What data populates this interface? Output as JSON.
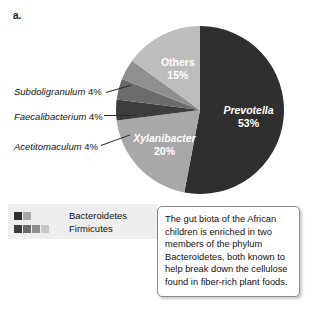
{
  "panel": {
    "letter": "a."
  },
  "chart_data": {
    "type": "pie",
    "title": "",
    "legend_position": "bottom-left",
    "start_angle_deg": 0,
    "direction": "clockwise",
    "categories": [
      "Prevotella",
      "Xylanibacter",
      "Acetitomaculum",
      "Faecalibacterium",
      "Subdoligranulum",
      "Others"
    ],
    "values": [
      53,
      20,
      4,
      4,
      4,
      15
    ],
    "unit": "%",
    "slices": [
      {
        "name": "Prevotella",
        "value": 53,
        "label": "Prevotella",
        "pct_label": "53%",
        "color": "#2f2f2f",
        "label_inside": true,
        "italic": true
      },
      {
        "name": "Xylanibacter",
        "value": 20,
        "label": "Xylanibacter",
        "pct_label": "20%",
        "color": "#a8a8a8",
        "label_inside": true,
        "italic": true
      },
      {
        "name": "Acetitomaculum",
        "value": 4,
        "label": "Acetitomaculum",
        "pct_label": "4%",
        "color": "#3d3d3d",
        "label_inside": false,
        "italic": true
      },
      {
        "name": "Faecalibacterium",
        "value": 4,
        "label": "Faecalibacterium",
        "pct_label": "4%",
        "color": "#6b6b6b",
        "label_inside": false,
        "italic": true
      },
      {
        "name": "Subdoligranulum",
        "value": 4,
        "label": "Subdoligranulum",
        "pct_label": "4%",
        "color": "#8f8f8f",
        "label_inside": false,
        "italic": true
      },
      {
        "name": "Others",
        "value": 15,
        "label": "Others",
        "pct_label": "15%",
        "color": "#bdbdbd",
        "label_inside": true,
        "italic": false
      }
    ]
  },
  "callouts": [
    {
      "name": "Subdoligranulum",
      "pct": "4%"
    },
    {
      "name": "Faecalibacterium",
      "pct": "4%"
    },
    {
      "name": "Acetitomaculum",
      "pct": "4%"
    }
  ],
  "legend": {
    "rows": [
      {
        "label": "Bacteroidetes",
        "colors": [
          "#2f2f2f",
          "#a8a8a8"
        ]
      },
      {
        "label": "Firmicutes",
        "colors": [
          "#3d3d3d",
          "#6b6b6b",
          "#8f8f8f",
          "#c9c9c9"
        ]
      }
    ]
  },
  "caption": {
    "text": "The gut biota of the African children is enriched in two members of the phylum Bacteroidetes, both known to help break down the cellulose found in fiber-rich plant foods."
  }
}
